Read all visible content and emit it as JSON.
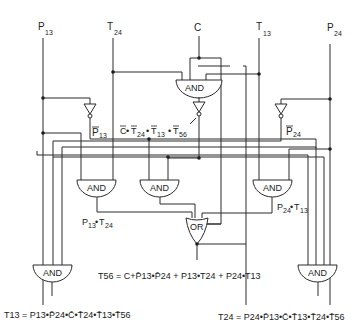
{
  "inputs": {
    "p13": {
      "name": "P",
      "sub": "13"
    },
    "t24": {
      "name": "T",
      "sub": "24"
    },
    "c": {
      "name": "C"
    },
    "t13": {
      "name": "T",
      "sub": "13"
    },
    "p24": {
      "name": "P",
      "sub": "24"
    }
  },
  "gates": {
    "top_and": "AND",
    "and_p13_t24": "AND",
    "and_middle": "AND",
    "and_p24_t13": "AND",
    "or_t56": "OR",
    "and_t13_out": "AND",
    "and_t24_out": "AND"
  },
  "signal_labels": {
    "p13_bar": {
      "name": "P",
      "sub": "13"
    },
    "p24_bar": {
      "name": "P",
      "sub": "24"
    },
    "middle_term": {
      "parts": [
        "C",
        "•",
        "T",
        "24",
        "•",
        "T",
        "13",
        "•",
        "T",
        "56"
      ]
    },
    "p13_t24": {
      "a": "P",
      "a_sub": "13",
      "dot": "•",
      "b": "T",
      "b_sub": "24"
    },
    "p24_t13": {
      "a": "P",
      "a_sub": "24",
      "dot": "•",
      "b": "T",
      "b_sub": "13"
    }
  },
  "equations": {
    "t56": "T56 = C+P̄13•P̄24 + P13•T24 + P24•T13",
    "t13": "T13 = P13•P̄24•C̄•T̄24•T̄13•T̄56",
    "t24": "T24 = P24•P̄13•C̄•T̄13•T̄24•T̄56"
  }
}
